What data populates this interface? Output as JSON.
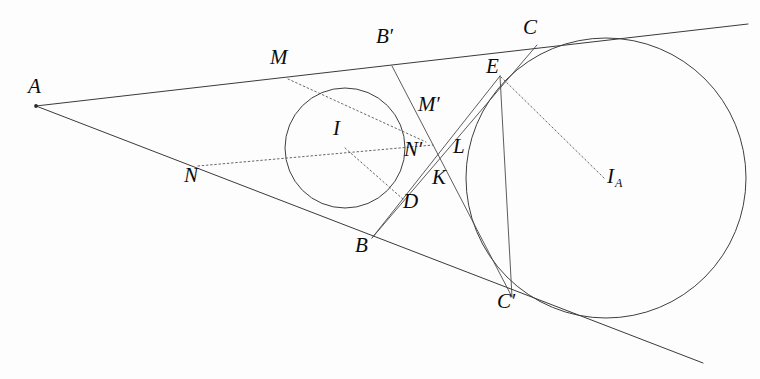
{
  "figure": {
    "type": "euclidean-geometry-diagram",
    "background_color": "#fdfdfd",
    "stroke_color": "#3a3a3a",
    "dotted_stroke_color": "#555555",
    "width": 760,
    "height": 379
  },
  "points": [
    {
      "id": "A",
      "label": "A",
      "sub": "",
      "prime": false,
      "x": 36,
      "y": 106,
      "label_x": 28,
      "label_y": 76,
      "dot": true
    },
    {
      "id": "M",
      "label": "M",
      "sub": "",
      "prime": false,
      "x": 288,
      "y": 79,
      "label_x": 270,
      "label_y": 47,
      "dot": false
    },
    {
      "id": "Bp",
      "label": "B",
      "sub": "",
      "prime": true,
      "x": 392,
      "y": 66,
      "label_x": 376,
      "label_y": 26,
      "dot": false
    },
    {
      "id": "C",
      "label": "C",
      "sub": "",
      "prime": false,
      "x": 537,
      "y": 45,
      "label_x": 523,
      "label_y": 17,
      "dot": false
    },
    {
      "id": "E",
      "label": "E",
      "sub": "",
      "prime": false,
      "x": 500,
      "y": 76,
      "label_x": 486,
      "label_y": 56,
      "dot": false
    },
    {
      "id": "Mp",
      "label": "M",
      "sub": "",
      "prime": true,
      "x": 420,
      "y": 117,
      "label_x": 418,
      "label_y": 94,
      "dot": false
    },
    {
      "id": "I",
      "label": "I",
      "sub": "",
      "prime": false,
      "x": 345,
      "y": 148,
      "label_x": 333,
      "label_y": 118,
      "dot": false
    },
    {
      "id": "L",
      "label": "L",
      "sub": "",
      "prime": false,
      "x": 448,
      "y": 149,
      "label_x": 453,
      "label_y": 136,
      "dot": false
    },
    {
      "id": "Np",
      "label": "N",
      "sub": "",
      "prime": true,
      "x": 420,
      "y": 152,
      "label_x": 404,
      "label_y": 139,
      "dot": false
    },
    {
      "id": "N",
      "label": "N",
      "sub": "",
      "prime": false,
      "x": 198,
      "y": 166,
      "label_x": 184,
      "label_y": 165,
      "dot": false
    },
    {
      "id": "K",
      "label": "K",
      "sub": "",
      "prime": false,
      "x": 437,
      "y": 172,
      "label_x": 432,
      "label_y": 167,
      "dot": false
    },
    {
      "id": "IA",
      "label": "I",
      "sub": "A",
      "prime": false,
      "x": 604,
      "y": 178,
      "label_x": 607,
      "label_y": 166,
      "dot": false
    },
    {
      "id": "D",
      "label": "D",
      "sub": "",
      "prime": false,
      "x": 404,
      "y": 200,
      "label_x": 403,
      "label_y": 191,
      "dot": false
    },
    {
      "id": "B",
      "label": "B",
      "sub": "",
      "prime": false,
      "x": 372,
      "y": 238,
      "label_x": 355,
      "label_y": 235,
      "dot": false
    },
    {
      "id": "Cp",
      "label": "C",
      "sub": "",
      "prime": true,
      "x": 512,
      "y": 297,
      "label_x": 497,
      "label_y": 291,
      "dot": false
    }
  ],
  "circles": [
    {
      "id": "incircle",
      "center_label": "I",
      "cx": 345,
      "cy": 148,
      "r": 60
    },
    {
      "id": "excircle",
      "center_label": "I_A",
      "cx": 606,
      "cy": 178,
      "r": 140
    }
  ],
  "solid_segments": [
    {
      "id": "upper-tangent",
      "from": "A",
      "to": "far-upper-right",
      "x1": 36,
      "y1": 106,
      "x2": 748,
      "y2": 24
    },
    {
      "id": "lower-tangent",
      "from": "A",
      "to": "far-lower-right",
      "x1": 36,
      "y1": 106,
      "x2": 703,
      "y2": 363
    },
    {
      "id": "side-Bprime-Cprime",
      "from": "Bp",
      "to": "Cp",
      "x1": 392,
      "y1": 66,
      "x2": 512,
      "y2": 297
    },
    {
      "id": "side-C-B",
      "from": "C",
      "to": "B",
      "x1": 537,
      "y1": 45,
      "x2": 372,
      "y2": 238
    },
    {
      "id": "segment-E-Cprime",
      "from": "E",
      "to": "Cp",
      "x1": 500,
      "y1": 76,
      "x2": 512,
      "y2": 297
    },
    {
      "id": "segment-E-D",
      "from": "E",
      "to": "D",
      "x1": 500,
      "y1": 76,
      "x2": 372,
      "y2": 238
    }
  ],
  "dotted_segments": [
    {
      "id": "radius-M-to-Mprime",
      "x1": 288,
      "y1": 79,
      "x2": 425,
      "y2": 142
    },
    {
      "id": "radius-N-to-Nprime",
      "x1": 198,
      "y1": 166,
      "x2": 432,
      "y2": 145
    },
    {
      "id": "radius-I-to-D",
      "x1": 345,
      "y1": 148,
      "x2": 404,
      "y2": 200
    },
    {
      "id": "radius-IA-to-E",
      "x1": 604,
      "y1": 178,
      "x2": 500,
      "y2": 76
    }
  ],
  "labels_note": "Primed labels M', N', B', C' use a straight apostrophe glyph; I_A uses a subscript capital A"
}
